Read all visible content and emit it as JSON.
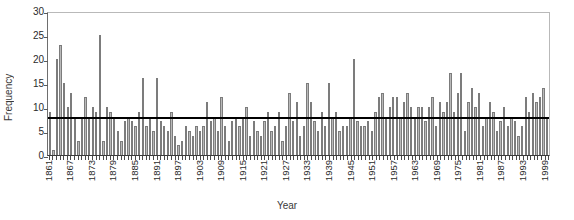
{
  "chart_data": {
    "type": "bar",
    "title": "",
    "xlabel": "Year",
    "ylabel": "Frequency",
    "ylim": [
      0,
      30
    ],
    "yticks": [
      0,
      5,
      10,
      15,
      20,
      25,
      30
    ],
    "xtick_labels": [
      "1861",
      "1867",
      "1873",
      "1879",
      "1885",
      "1891",
      "1897",
      "1903",
      "1909",
      "1915",
      "1921",
      "1927",
      "1933",
      "1939",
      "1945",
      "1951",
      "1957",
      "1963",
      "1969",
      "1975",
      "1981",
      "1987",
      "1993",
      "1999"
    ],
    "xtick_step": 6,
    "grid": false,
    "legend": null,
    "bar_color": "#b9b9b9",
    "bar_edge_color": "#7c7c7c",
    "reference_line": {
      "value": 7.5,
      "color": "#000000",
      "label": "mean"
    },
    "categories": [
      1861,
      1862,
      1863,
      1864,
      1865,
      1866,
      1867,
      1868,
      1869,
      1870,
      1871,
      1872,
      1873,
      1874,
      1875,
      1876,
      1877,
      1878,
      1879,
      1880,
      1881,
      1882,
      1883,
      1884,
      1885,
      1886,
      1887,
      1888,
      1889,
      1890,
      1891,
      1892,
      1893,
      1894,
      1895,
      1896,
      1897,
      1898,
      1899,
      1900,
      1901,
      1902,
      1903,
      1904,
      1905,
      1906,
      1907,
      1908,
      1909,
      1910,
      1911,
      1912,
      1913,
      1914,
      1915,
      1916,
      1917,
      1918,
      1919,
      1920,
      1921,
      1922,
      1923,
      1924,
      1925,
      1926,
      1927,
      1928,
      1929,
      1930,
      1931,
      1932,
      1933,
      1934,
      1935,
      1936,
      1937,
      1938,
      1939,
      1940,
      1941,
      1942,
      1943,
      1944,
      1945,
      1946,
      1947,
      1948,
      1949,
      1950,
      1951,
      1952,
      1953,
      1954,
      1955,
      1956,
      1957,
      1958,
      1959,
      1960,
      1961,
      1962,
      1963,
      1964,
      1965,
      1966,
      1967,
      1968,
      1969,
      1970,
      1971,
      1972,
      1973,
      1974,
      1975,
      1976,
      1977,
      1978,
      1979,
      1980,
      1981,
      1982,
      1983,
      1984,
      1985,
      1986,
      1987,
      1988,
      1989,
      1990,
      1991,
      1992,
      1993,
      1994,
      1995,
      1996,
      1997,
      1998,
      1999,
      2000
    ],
    "values": [
      9,
      1,
      20,
      23,
      15,
      10,
      13,
      8,
      3,
      8,
      12,
      8,
      10,
      9,
      25,
      3,
      10,
      9,
      8,
      5,
      3,
      7,
      8,
      7,
      6,
      9,
      16,
      6,
      8,
      5,
      16,
      7,
      6,
      5,
      9,
      4,
      2,
      3,
      6,
      5,
      4,
      6,
      5,
      6,
      11,
      7,
      8,
      5,
      12,
      6,
      3,
      7,
      8,
      6,
      8,
      10,
      4,
      7,
      5,
      4,
      7,
      9,
      5,
      6,
      9,
      3,
      6,
      13,
      7,
      11,
      4,
      6,
      15,
      11,
      7,
      5,
      9,
      6,
      15,
      8,
      9,
      5,
      6,
      6,
      8,
      20,
      7,
      6,
      6,
      7,
      5,
      9,
      12,
      13,
      8,
      10,
      12,
      12,
      8,
      11,
      13,
      10,
      8,
      10,
      10,
      7,
      10,
      12,
      6,
      11,
      9,
      11,
      17,
      9,
      13,
      17,
      5,
      11,
      14,
      10,
      13,
      6,
      8,
      11,
      9,
      5,
      7,
      10,
      6,
      8,
      7,
      4,
      6,
      12,
      9,
      13,
      11,
      12,
      14,
      8
    ]
  }
}
